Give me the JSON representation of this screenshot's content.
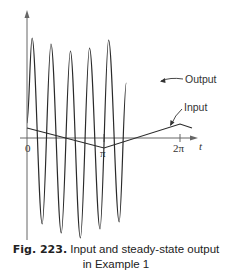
{
  "figure": {
    "number_label": "Fig. 223.",
    "caption_line1": "Input and steady-state output",
    "caption_line2": "in Example 1"
  },
  "labels": {
    "output": "Output",
    "input": "Input",
    "t_axis": "t",
    "tick_0": "0",
    "tick_pi": "π",
    "tick_2pi": "2π"
  },
  "colors": {
    "line": "#2a2a2a",
    "axis": "#555555",
    "background": "#ffffff"
  },
  "chart_data": {
    "type": "line",
    "title": "Input and steady-state output in Example 1",
    "xlabel": "t",
    "ylabel": "",
    "x_ticks": [
      "0",
      "π",
      "2π"
    ],
    "xlim": [
      0,
      6.6
    ],
    "grid": false,
    "legend": "inline annotations (Output, Input)",
    "series": [
      {
        "name": "Output",
        "description": "High-frequency, large-amplitude oscillation (about 5 periods over 0..2π) with slightly varying peak heights",
        "peaks": [
          {
            "t": 0.21,
            "y": 1.0
          },
          {
            "t": 0.98,
            "y": 0.94
          },
          {
            "t": 1.77,
            "y": 0.87
          },
          {
            "t": 2.55,
            "y": 0.9
          },
          {
            "t": 3.33,
            "y": 0.98
          }
        ],
        "troughs": [
          {
            "t": 0.62,
            "y": -0.86
          },
          {
            "t": 1.4,
            "y": -0.95
          },
          {
            "t": 2.18,
            "y": -1.0
          },
          {
            "t": 2.98,
            "y": -0.91
          },
          {
            "t": 3.76,
            "y": -0.84
          }
        ]
      },
      {
        "name": "Input",
        "description": "Small-amplitude triangular wave: decreasing from t=0 to minimum at t=π, increasing to maximum at t=2π",
        "x": [
          0,
          3.1416,
          6.2832,
          6.6
        ],
        "values": [
          0.1,
          -0.1,
          0.14,
          0.1
        ]
      }
    ]
  }
}
